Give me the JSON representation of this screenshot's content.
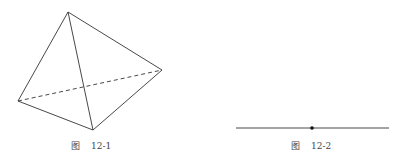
{
  "figures": [
    {
      "caption_prefix": "图",
      "caption_number": "12-1",
      "description": "tetrahedron with one hidden (dashed) edge"
    },
    {
      "caption_prefix": "图",
      "caption_number": "12-2",
      "description": "line segment with a point on it"
    }
  ]
}
